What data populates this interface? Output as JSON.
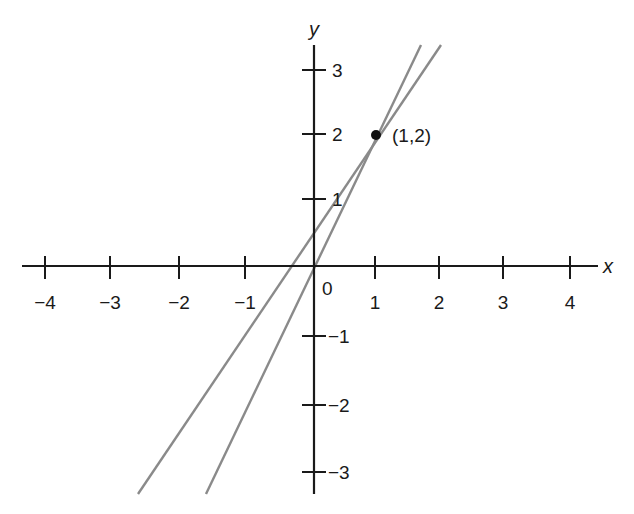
{
  "diagram": {
    "type": "coordinate-plane",
    "axes": {
      "x_label": "x",
      "y_label": "y",
      "origin_label": "0",
      "x_ticks": [
        "−4",
        "−3",
        "−2",
        "−1",
        "1",
        "2",
        "3",
        "4"
      ],
      "y_ticks_positive": [
        "1",
        "2",
        "3"
      ],
      "y_ticks_negative": [
        "−1",
        "−2",
        "−3"
      ]
    },
    "point": {
      "label": "(1,2)",
      "x": 1,
      "y": 2
    },
    "lines": [
      {
        "name": "steeper line through (1,2) and origin",
        "slope": 2,
        "intercept": 0,
        "color": "#8a8a8a"
      },
      {
        "name": "shallower line through (1,2)",
        "slope": 1.5,
        "intercept": 0.5,
        "color": "#8a8a8a"
      }
    ],
    "colors": {
      "axis": "#1a1a1a",
      "line": "#8a8a8a",
      "point": "#111111"
    }
  }
}
